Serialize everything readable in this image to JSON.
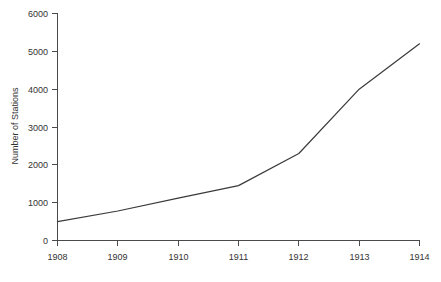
{
  "chart_data": {
    "type": "line",
    "title": "",
    "xlabel": "",
    "ylabel": "Number of Stations",
    "x": [
      1908,
      1909,
      1910,
      1911,
      1912,
      1913,
      1914
    ],
    "values": [
      500,
      780,
      1120,
      1450,
      2300,
      4000,
      5200
    ],
    "series": [
      {
        "name": "Number of Stations",
        "values": [
          500,
          780,
          1120,
          1450,
          2300,
          4000,
          5200
        ]
      }
    ],
    "xtick_labels": [
      "1908",
      "1909",
      "1910",
      "1911",
      "1912",
      "1913",
      "1914"
    ],
    "ytick_labels": [
      "0",
      "1000",
      "2000",
      "3000",
      "4000",
      "5000",
      "6000"
    ],
    "ytick_values": [
      0,
      1000,
      2000,
      3000,
      4000,
      5000,
      6000
    ],
    "xlim": [
      1908,
      1914
    ],
    "ylim": [
      0,
      6000
    ],
    "grid": false,
    "legend": false,
    "line_color": "#3a3a3a",
    "axis_color": "#4a4a4a",
    "background_color": "#ffffff"
  },
  "axes": {
    "y_axis_title": "Number of Stations",
    "x_axis_title": ""
  },
  "yticks": [
    {
      "label": "6000",
      "value": 6000
    },
    {
      "label": "5000",
      "value": 5000
    },
    {
      "label": "4000",
      "value": 4000
    },
    {
      "label": "3000",
      "value": 3000
    },
    {
      "label": "2000",
      "value": 2000
    },
    {
      "label": "1000",
      "value": 1000
    },
    {
      "label": "0",
      "value": 0
    }
  ],
  "xticks": [
    {
      "label": "1908",
      "value": 1908
    },
    {
      "label": "1909",
      "value": 1909
    },
    {
      "label": "1910",
      "value": 1910
    },
    {
      "label": "1911",
      "value": 1911
    },
    {
      "label": "1912",
      "value": 1912
    },
    {
      "label": "1913",
      "value": 1913
    },
    {
      "label": "1914",
      "value": 1914
    }
  ]
}
